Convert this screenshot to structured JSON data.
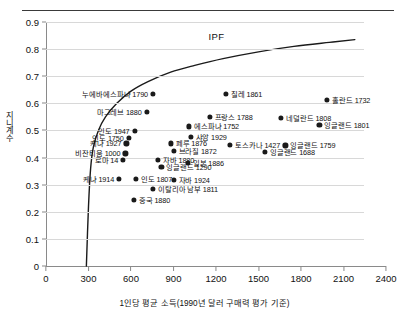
{
  "chart_data": {
    "type": "scatter",
    "title": "",
    "xlabel": "1인당 평균 소득(1990년 달러 구매력 평가 기준)",
    "ylabel": "지니계수",
    "xlim": [
      0,
      2400
    ],
    "ylim": [
      0,
      0.9
    ],
    "xticks": [
      0,
      300,
      600,
      900,
      1200,
      1500,
      1800,
      2100,
      2400
    ],
    "yticks": [
      "0",
      "0.1",
      "0.2",
      "0.3",
      "0.4",
      "0.5",
      "0.6",
      "0.7",
      "0.8",
      "0.9"
    ],
    "grid": true,
    "legend": "none",
    "curve_label": "IPF",
    "curve_description": "Inequality Possibility Frontier",
    "curve_points": [
      [
        285,
        0.0
      ],
      [
        300,
        0.22
      ],
      [
        315,
        0.36
      ],
      [
        335,
        0.44
      ],
      [
        370,
        0.5
      ],
      [
        420,
        0.55
      ],
      [
        500,
        0.6
      ],
      [
        600,
        0.645
      ],
      [
        720,
        0.68
      ],
      [
        880,
        0.715
      ],
      [
        1050,
        0.74
      ],
      [
        1250,
        0.765
      ],
      [
        1500,
        0.79
      ],
      [
        1750,
        0.81
      ],
      [
        2000,
        0.825
      ],
      [
        2180,
        0.835
      ]
    ],
    "points": [
      {
        "label": "누에바에스파냐 1790",
        "x": 755,
        "y": 0.635,
        "label_side": "left"
      },
      {
        "label": "마그레브 1880",
        "x": 710,
        "y": 0.568,
        "label_side": "left"
      },
      {
        "label": "칠레 1861",
        "x": 1270,
        "y": 0.635,
        "label_side": "right"
      },
      {
        "label": "홀란드 1732",
        "x": 1985,
        "y": 0.614,
        "label_side": "right"
      },
      {
        "label": "인도 1947",
        "x": 625,
        "y": 0.497,
        "label_side": "left"
      },
      {
        "label": "에스파냐 1752",
        "x": 1010,
        "y": 0.515,
        "label_side": "right"
      },
      {
        "label": "프랑스 1788",
        "x": 1155,
        "y": 0.551,
        "label_side": "right"
      },
      {
        "label": "네덜란드 1808",
        "x": 1660,
        "y": 0.545,
        "label_side": "right"
      },
      {
        "label": "잉글랜드 1801",
        "x": 1930,
        "y": 0.52,
        "label_side": "right"
      },
      {
        "label": "인도 1750",
        "x": 583,
        "y": 0.472,
        "label_side": "left"
      },
      {
        "label": "샤암 1929",
        "x": 1020,
        "y": 0.477,
        "label_side": "right"
      },
      {
        "label": "케냐 1927",
        "x": 567,
        "y": 0.452,
        "label_side": "left"
      },
      {
        "label": "페루 1876",
        "x": 880,
        "y": 0.452,
        "label_side": "right"
      },
      {
        "label": "토스카나 1427",
        "x": 1300,
        "y": 0.448,
        "label_side": "right"
      },
      {
        "label": "잉글랜드 1759",
        "x": 1690,
        "y": 0.445,
        "label_side": "right"
      },
      {
        "label": "비잔티움 1000",
        "x": 560,
        "y": 0.415,
        "label_side": "left"
      },
      {
        "label": "브라질 1872",
        "x": 900,
        "y": 0.424,
        "label_side": "right"
      },
      {
        "label": "잉글랜드 1688",
        "x": 1545,
        "y": 0.42,
        "label_side": "right"
      },
      {
        "label": "로마 14",
        "x": 545,
        "y": 0.392,
        "label_side": "left"
      },
      {
        "label": "자바 1880",
        "x": 790,
        "y": 0.39,
        "label_side": "right"
      },
      {
        "label": "잉글랜드 1290",
        "x": 815,
        "y": 0.366,
        "label_side": "right"
      },
      {
        "label": "일본 1886",
        "x": 1000,
        "y": 0.38,
        "label_side": "right"
      },
      {
        "label": "케냐 1914",
        "x": 516,
        "y": 0.32,
        "label_side": "left"
      },
      {
        "label": "인도 1807",
        "x": 635,
        "y": 0.32,
        "label_side": "right"
      },
      {
        "label": "자바 1924",
        "x": 900,
        "y": 0.318,
        "label_side": "right"
      },
      {
        "label": "이탈리아 남부 1811",
        "x": 755,
        "y": 0.285,
        "label_side": "right"
      },
      {
        "label": "중국 1880",
        "x": 620,
        "y": 0.243,
        "label_side": "right"
      }
    ]
  }
}
